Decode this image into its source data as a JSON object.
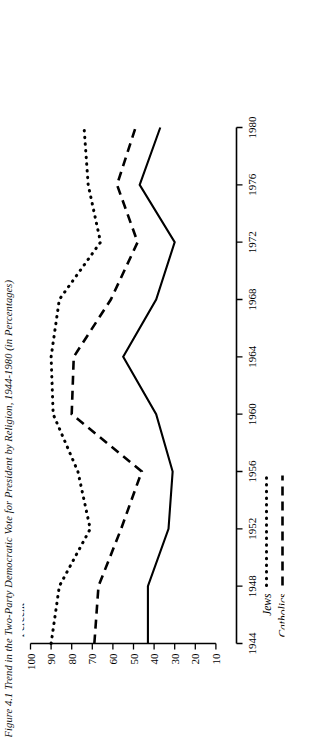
{
  "figure": {
    "title": "Figure 4.1 Trend in the Two-Party Democratic Vote for President by Religion, 1944-1980 (in Percentages)",
    "y_axis_name": "Percent"
  },
  "chart_data": {
    "type": "line",
    "title": "Figure 4.1 Trend in the Two-Party Democratic Vote for President by Religion, 1944-1980 (in Percentages)",
    "xlabel": "",
    "ylabel": "Percent",
    "xlim": [
      1944,
      1980
    ],
    "ylim": [
      0,
      100
    ],
    "grid": false,
    "legend_position": "below-axis",
    "x": [
      1944,
      1948,
      1952,
      1956,
      1960,
      1964,
      1968,
      1972,
      1976,
      1980
    ],
    "xticks": [
      "1944",
      "1948",
      "1952",
      "1956",
      "1960",
      "1964",
      "1968",
      "1972",
      "1976",
      "1980"
    ],
    "yticks": [
      "100",
      "90",
      "80",
      "70",
      "60",
      "50",
      "40",
      "30",
      "20",
      "10"
    ],
    "series": [
      {
        "name": "Jews",
        "style": "dotted",
        "values": [
          90,
          86,
          71,
          77,
          89,
          90,
          86,
          66,
          72,
          74
        ]
      },
      {
        "name": "Catholics",
        "style": "dashed",
        "values": [
          69,
          67,
          56,
          46,
          80,
          79,
          61,
          48,
          58,
          49
        ]
      },
      {
        "name": "Protestants",
        "style": "solid",
        "values": [
          43,
          43,
          33,
          31,
          39,
          55,
          39,
          30,
          47,
          37
        ]
      }
    ]
  },
  "legend": {
    "items": [
      {
        "label": "Jews",
        "style": "dotted"
      },
      {
        "label": "Catholics",
        "style": "dashed"
      },
      {
        "label": "Protestants",
        "style": "solid"
      }
    ]
  }
}
